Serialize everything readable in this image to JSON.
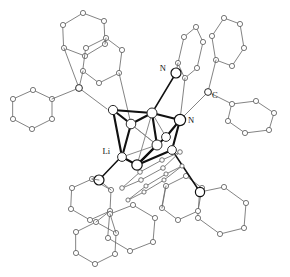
{
  "figure": {
    "kind": "crystal-structure-diagram",
    "title": "",
    "background_color": "#ffffff",
    "width": 290,
    "height": 277,
    "colors": {
      "core_bond": "#111111",
      "ligand_bond": "#6d6d6d",
      "atom_fill": "#ffffff",
      "atom_outline": "#2a2a2a",
      "label_text": "#111111"
    }
  },
  "atom_labels": [
    {
      "id": "label-n-top",
      "text": "N",
      "x": 166,
      "y": 69
    },
    {
      "id": "label-c-right",
      "text": "C",
      "x": 212,
      "y": 96
    },
    {
      "id": "label-n-right",
      "text": "N",
      "x": 188,
      "y": 121
    },
    {
      "id": "label-li-left",
      "text": "Li",
      "x": 110,
      "y": 152
    }
  ],
  "core": {
    "description": "Li4N4 cubane core drawn with heavy solid bonds",
    "atoms": [
      {
        "id": "N1",
        "x": 152,
        "y": 113,
        "r": 5.0,
        "kind": "med"
      },
      {
        "id": "N2",
        "x": 180,
        "y": 120,
        "r": 5.6,
        "kind": "big"
      },
      {
        "id": "N3",
        "x": 131,
        "y": 124,
        "r": 4.8,
        "kind": "med"
      },
      {
        "id": "N4",
        "x": 157,
        "y": 145,
        "r": 5.0,
        "kind": "med"
      },
      {
        "id": "Li1",
        "x": 113,
        "y": 110,
        "r": 4.6,
        "kind": "med"
      },
      {
        "id": "Li2",
        "x": 122,
        "y": 157,
        "r": 4.4,
        "kind": "med"
      },
      {
        "id": "Li3",
        "x": 137,
        "y": 165,
        "r": 5.2,
        "kind": "big"
      },
      {
        "id": "Li4",
        "x": 166,
        "y": 137,
        "r": 4.4,
        "kind": "med"
      }
    ],
    "bonds": [
      [
        "N1",
        "N2"
      ],
      [
        "N1",
        "N3"
      ],
      [
        "N1",
        "Li1"
      ],
      [
        "N2",
        "Li4"
      ],
      [
        "N3",
        "Li2"
      ],
      [
        "N2",
        "N4"
      ],
      [
        "N4",
        "Li3"
      ],
      [
        "Li1",
        "Li2"
      ],
      [
        "Li2",
        "Li3"
      ],
      [
        "Li3",
        "N4"
      ],
      [
        "N1",
        "N4"
      ],
      [
        "Li4",
        "N4"
      ],
      [
        "N3",
        "Li3"
      ],
      [
        "Li1",
        "N3"
      ],
      [
        "N2",
        "Li3"
      ]
    ]
  },
  "ligands": {
    "count_phenyl_rings": 12,
    "description": "Twelve phenyl rings drawn as open hexagons with small circles at each carbon vertex, linked through quaternary carbon and imine nitrogen atoms to the metal core."
  },
  "accessibility": {
    "alt": "Ball-and-stick X-ray crystal structure of a lithium amide cubane showing a central Li4N4 core labelled Li, N, N and C, surrounded by twelve phenyl rings."
  }
}
